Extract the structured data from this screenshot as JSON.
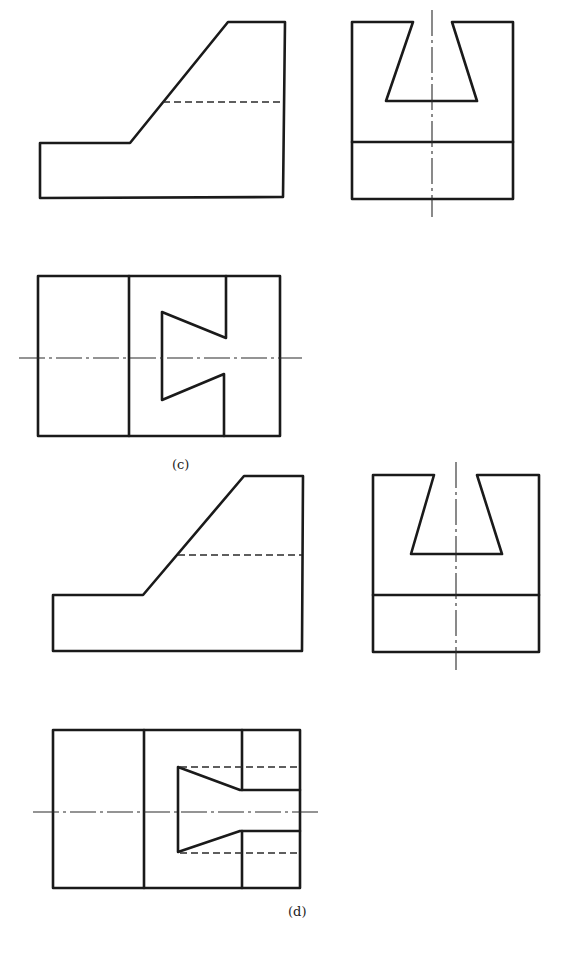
{
  "figures": [
    {
      "id": "c",
      "label": "(c)",
      "views": [
        "front-view",
        "side-view",
        "top-view"
      ]
    },
    {
      "id": "d",
      "label": "(d)",
      "views": [
        "front-view",
        "side-view",
        "top-view"
      ]
    }
  ],
  "colors": {
    "line": "#1a1a1a",
    "background": "#ffffff"
  }
}
